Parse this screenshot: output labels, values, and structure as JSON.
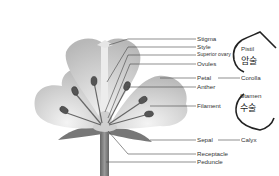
{
  "diagram": {
    "labels": [
      {
        "id": "stigma",
        "text": "Stigma"
      },
      {
        "id": "style",
        "text": "Style"
      },
      {
        "id": "superior-ovary",
        "text": "Superior ovary"
      },
      {
        "id": "ovules",
        "text": "Ovules"
      },
      {
        "id": "petal",
        "text": "Petal"
      },
      {
        "id": "anther",
        "text": "Anther"
      },
      {
        "id": "filament",
        "text": "Filament"
      },
      {
        "id": "sepal",
        "text": "Sepal"
      },
      {
        "id": "receptacle",
        "text": "Receptacle"
      },
      {
        "id": "peduncle",
        "text": "Peduncle"
      }
    ],
    "groups": {
      "pistil": {
        "text": "Pistil",
        "korean": "암술"
      },
      "corolla": {
        "text": "Corolla"
      },
      "stamen": {
        "text": "Stamen",
        "korean": "수술"
      },
      "calyx": {
        "text": "Calyx"
      }
    },
    "colors": {
      "petal": "#c8c8c8",
      "anther": "#555555",
      "stem": "#777777",
      "line": "#444444",
      "annotation": "#222222"
    }
  }
}
